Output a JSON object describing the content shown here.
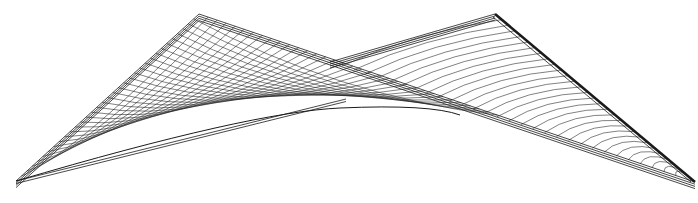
{
  "figure": {
    "stroke_color": "#1a1a1a",
    "background": "#ffffff",
    "points": {
      "left_base": [
        16,
        181
      ],
      "left_apex": [
        199,
        14
      ],
      "right_apex": [
        495,
        14
      ],
      "right_base": [
        695,
        182
      ],
      "cross_left": [
        330,
        62
      ],
      "sag_low": [
        340,
        108
      ]
    },
    "rulings_left": 34,
    "rulings_right": 30
  }
}
